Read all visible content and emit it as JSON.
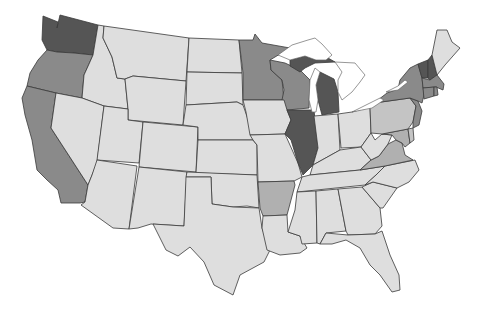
{
  "map": {
    "type": "choropleth",
    "region": "contiguous-united-states",
    "palette": {
      "level_1": "#dedede",
      "level_2": "#c4c4c4",
      "level_3": "#b0b0b0",
      "level_4": "#8a8a8a",
      "level_5": "#555555"
    },
    "states": [
      {
        "id": "WA",
        "level": 5
      },
      {
        "id": "OR",
        "level": 4
      },
      {
        "id": "CA",
        "level": 4
      },
      {
        "id": "ID",
        "level": 1
      },
      {
        "id": "NV",
        "level": 1
      },
      {
        "id": "MT",
        "level": 1
      },
      {
        "id": "WY",
        "level": 1
      },
      {
        "id": "UT",
        "level": 1
      },
      {
        "id": "AZ",
        "level": 1
      },
      {
        "id": "CO",
        "level": 1
      },
      {
        "id": "NM",
        "level": 1
      },
      {
        "id": "ND",
        "level": 1
      },
      {
        "id": "SD",
        "level": 1
      },
      {
        "id": "NE",
        "level": 1
      },
      {
        "id": "KS",
        "level": 1
      },
      {
        "id": "OK",
        "level": 1
      },
      {
        "id": "TX",
        "level": 1
      },
      {
        "id": "MN",
        "level": 4
      },
      {
        "id": "IA",
        "level": 1
      },
      {
        "id": "MO",
        "level": 1
      },
      {
        "id": "AR",
        "level": 3
      },
      {
        "id": "LA",
        "level": 1
      },
      {
        "id": "WI",
        "level": 4
      },
      {
        "id": "IL",
        "level": 5
      },
      {
        "id": "MI",
        "level": 5
      },
      {
        "id": "IN",
        "level": 1
      },
      {
        "id": "OH",
        "level": 1
      },
      {
        "id": "KY",
        "level": 1
      },
      {
        "id": "TN",
        "level": 1
      },
      {
        "id": "MS",
        "level": 1
      },
      {
        "id": "AL",
        "level": 1
      },
      {
        "id": "GA",
        "level": 1
      },
      {
        "id": "FL",
        "level": 1
      },
      {
        "id": "SC",
        "level": 1
      },
      {
        "id": "NC",
        "level": 1
      },
      {
        "id": "VA",
        "level": 3
      },
      {
        "id": "WV",
        "level": 1
      },
      {
        "id": "MD",
        "level": 3
      },
      {
        "id": "DE",
        "level": 2
      },
      {
        "id": "PA",
        "level": 2
      },
      {
        "id": "NJ",
        "level": 4
      },
      {
        "id": "NY",
        "level": 4
      },
      {
        "id": "CT",
        "level": 4
      },
      {
        "id": "RI",
        "level": 4
      },
      {
        "id": "MA",
        "level": 4
      },
      {
        "id": "VT",
        "level": 5
      },
      {
        "id": "NH",
        "level": 5
      },
      {
        "id": "ME",
        "level": 1
      }
    ]
  }
}
